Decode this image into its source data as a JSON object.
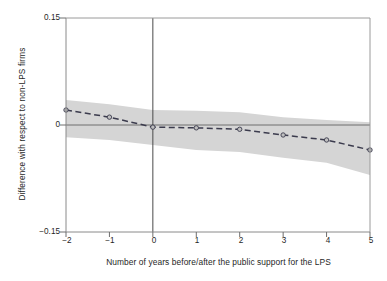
{
  "chart_data": {
    "type": "line",
    "title": "",
    "xlabel": "Number of years before/after the public support for the LPS",
    "ylabel": "Difference with respect to non-LPS firms",
    "xlim": [
      -2,
      5
    ],
    "ylim": [
      -0.15,
      0.15
    ],
    "xticks": [
      "−2",
      "−1",
      "0",
      "1",
      "2",
      "3",
      "4",
      "5"
    ],
    "xtick_values": [
      -2,
      -1,
      0,
      1,
      2,
      3,
      4,
      5
    ],
    "yticks": [
      "0.15",
      "0",
      "−0.15"
    ],
    "ytick_values": [
      0.15,
      0,
      -0.15
    ],
    "grid": false,
    "legend": "none",
    "x": [
      -2,
      -1,
      0,
      1,
      2,
      3,
      4,
      5
    ],
    "series": [
      {
        "name": "Difference with respect to non-LPS firms",
        "style": "dashed",
        "marker": "circle",
        "color": "#3b3b4d",
        "values": [
          0.021,
          0.011,
          -0.003,
          -0.004,
          -0.006,
          -0.014,
          -0.021,
          -0.035
        ]
      }
    ],
    "confidence_band": {
      "name": "Confidence interval",
      "fill_color": "#d5d5d5",
      "upper": [
        0.035,
        0.029,
        0.021,
        0.02,
        0.018,
        0.011,
        0.007,
        0.004
      ],
      "lower": [
        -0.017,
        -0.021,
        -0.028,
        -0.035,
        -0.038,
        -0.046,
        -0.053,
        -0.07
      ]
    },
    "reference_lines": [
      {
        "name": "zero-horizontal-line",
        "orientation": "horizontal",
        "value": 0,
        "color": "#6e6e6e"
      },
      {
        "name": "event-time-vertical-line",
        "orientation": "vertical",
        "value": 0,
        "color": "#4a4a4a"
      }
    ],
    "annotations": []
  }
}
